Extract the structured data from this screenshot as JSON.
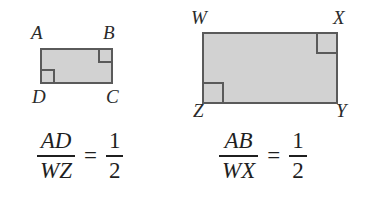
{
  "figure": {
    "colors": {
      "shape_fill": "#d2d2d2",
      "shape_stroke": "#5a5a5a",
      "label_text": "#2a2a2a",
      "equation_text": "#1f1f1f",
      "background": "#ffffff"
    },
    "shapes": [
      {
        "id": "small-rectangle",
        "vertices": [
          {
            "name": "A",
            "label": "A",
            "position": "top-left"
          },
          {
            "name": "B",
            "label": "B",
            "position": "top-right"
          },
          {
            "name": "C",
            "label": "C",
            "position": "bottom-right"
          },
          {
            "name": "D",
            "label": "D",
            "position": "bottom-left"
          }
        ],
        "right_angle_marks": [
          "top-right",
          "bottom-left"
        ]
      },
      {
        "id": "large-rectangle",
        "vertices": [
          {
            "name": "W",
            "label": "W",
            "position": "top-left"
          },
          {
            "name": "X",
            "label": "X",
            "position": "top-right"
          },
          {
            "name": "Y",
            "label": "Y",
            "position": "bottom-right"
          },
          {
            "name": "Z",
            "label": "Z",
            "position": "bottom-left"
          }
        ],
        "right_angle_marks": [
          "top-right",
          "bottom-left"
        ]
      }
    ],
    "equations": [
      {
        "id": "ratio-ad-wz",
        "numerator": "AD",
        "denominator": "WZ",
        "equals": "=",
        "result_numerator": "1",
        "result_denominator": "2"
      },
      {
        "id": "ratio-ab-wx",
        "numerator": "AB",
        "denominator": "WX",
        "equals": "=",
        "result_numerator": "1",
        "result_denominator": "2"
      }
    ]
  }
}
